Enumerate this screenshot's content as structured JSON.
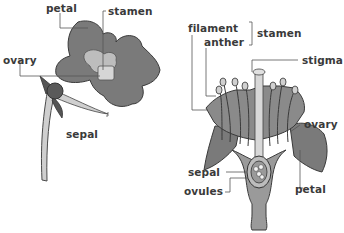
{
  "diagram": {
    "type": "botanical-illustration",
    "panels": [
      {
        "name": "external-view",
        "labels": {
          "petal": "petal",
          "stamen": "stamen",
          "ovary": "ovary",
          "sepal": "sepal"
        }
      },
      {
        "name": "cross-section",
        "labels": {
          "filament": "filament",
          "anther": "anther",
          "stamen": "stamen",
          "stigma": "stigma",
          "ovary": "ovary",
          "sepal": "sepal",
          "ovules": "ovules",
          "petal": "petal"
        }
      }
    ],
    "colors": {
      "petal_fill": "#7a7a7a",
      "petal_dark": "#5e5e5e",
      "light_part": "#bdbdbd",
      "pale": "#dcdcdc",
      "outline": "#3a3a3a",
      "leader_line": "#555555",
      "background": "#ffffff"
    }
  }
}
